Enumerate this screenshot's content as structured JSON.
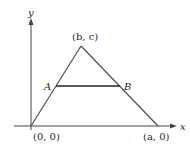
{
  "diagram": {
    "type": "geometry",
    "axes": {
      "x_label": "x",
      "y_label": "y",
      "color": "#444444"
    },
    "triangle": {
      "color": "#555555",
      "vertices": [
        {
          "id": "origin",
          "label": "(0, 0)"
        },
        {
          "id": "apex",
          "label": "(b, c)"
        },
        {
          "id": "base-right",
          "label": "(a, 0)"
        }
      ]
    },
    "segment": {
      "color": "#222222",
      "endpoints": [
        {
          "id": "A",
          "label": "A"
        },
        {
          "id": "B",
          "label": "B"
        }
      ]
    }
  }
}
